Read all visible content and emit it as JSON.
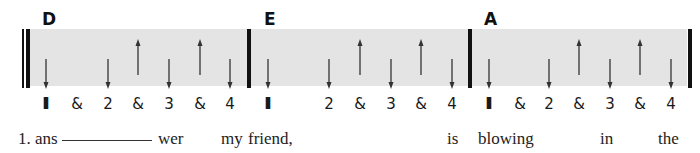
{
  "song": {
    "verse_number": "1.",
    "measures": [
      {
        "chord": "D",
        "chord_x": 42,
        "beats": [
          {
            "label": "I",
            "x": 46,
            "stroke": "down"
          },
          {
            "label": "&",
            "x": 77,
            "stroke": "none"
          },
          {
            "label": "2",
            "x": 108,
            "stroke": "down"
          },
          {
            "label": "&",
            "x": 138,
            "stroke": "up"
          },
          {
            "label": "3",
            "x": 169,
            "stroke": "down"
          },
          {
            "label": "&",
            "x": 200,
            "stroke": "up"
          },
          {
            "label": "4",
            "x": 230,
            "stroke": "down"
          }
        ]
      },
      {
        "chord": "E",
        "chord_x": 264,
        "beats": [
          {
            "label": "I",
            "x": 268,
            "stroke": "down"
          },
          {
            "label": "",
            "x": 298,
            "stroke": "none"
          },
          {
            "label": "2",
            "x": 329,
            "stroke": "down"
          },
          {
            "label": "&",
            "x": 360,
            "stroke": "up"
          },
          {
            "label": "3",
            "x": 391,
            "stroke": "down"
          },
          {
            "label": "&",
            "x": 421,
            "stroke": "up"
          },
          {
            "label": "4",
            "x": 452,
            "stroke": "down"
          }
        ]
      },
      {
        "chord": "A",
        "chord_x": 484,
        "beats": [
          {
            "label": "I",
            "x": 489,
            "stroke": "down"
          },
          {
            "label": "&",
            "x": 520,
            "stroke": "none"
          },
          {
            "label": "2",
            "x": 549,
            "stroke": "down"
          },
          {
            "label": "&",
            "x": 579,
            "stroke": "up"
          },
          {
            "label": "3",
            "x": 610,
            "stroke": "down"
          },
          {
            "label": "&",
            "x": 640,
            "stroke": "up"
          },
          {
            "label": "4",
            "x": 671,
            "stroke": "down"
          }
        ]
      }
    ],
    "lyrics": [
      {
        "text": "1. ans",
        "x": 18
      },
      {
        "text": "wer",
        "x": 158
      },
      {
        "text": "my",
        "x": 221
      },
      {
        "text": "friend,",
        "x": 248
      },
      {
        "text": "is",
        "x": 447
      },
      {
        "text": "blowing",
        "x": 478
      },
      {
        "text": "in",
        "x": 600
      },
      {
        "text": "the",
        "x": 658
      }
    ],
    "hyphen_line": {
      "x1": 62,
      "x2": 152
    },
    "barlines": [
      {
        "x": 22,
        "w": 2,
        "type": "thin-start"
      },
      {
        "x": 26,
        "w": 4,
        "type": "thick-start"
      },
      {
        "x": 247,
        "w": 4,
        "type": "bar"
      },
      {
        "x": 468,
        "w": 4,
        "type": "bar"
      },
      {
        "x": 688,
        "w": 4,
        "type": "bar-end"
      }
    ],
    "colors": {
      "band": "#e4e4e4",
      "ink": "#111111",
      "arrow": "#333333"
    }
  }
}
